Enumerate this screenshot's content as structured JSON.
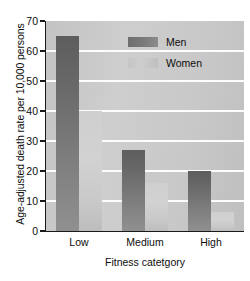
{
  "chart_data": {
    "type": "bar",
    "title": "",
    "subtitle": "",
    "categories": [
      "Low",
      "Medium",
      "High"
    ],
    "series": [
      {
        "name": "Men",
        "values": [
          65,
          27,
          20
        ],
        "color": "#6e6e6e"
      },
      {
        "name": "Women",
        "values": [
          40,
          16,
          6.5
        ],
        "color": "#c8c8c8"
      }
    ],
    "xlabel": "Fitness catetgory",
    "ylabel": "Age-adjusted death rate per 10,000 persons",
    "ylim": [
      0,
      70
    ],
    "ytick_labels": [
      "0",
      "10",
      "20",
      "30",
      "40",
      "50",
      "60",
      "70"
    ],
    "ytick_values": [
      0,
      10,
      20,
      30,
      40,
      50,
      60,
      70
    ],
    "grid": "horizontal",
    "legend_position": "top-right",
    "plot_background": "#c8c8c8",
    "gridline_color": "#fdfdfd",
    "axis_color": "#1a1a1a"
  },
  "legend": {
    "entries": [
      {
        "label": "Men"
      },
      {
        "label": "Women"
      }
    ]
  }
}
